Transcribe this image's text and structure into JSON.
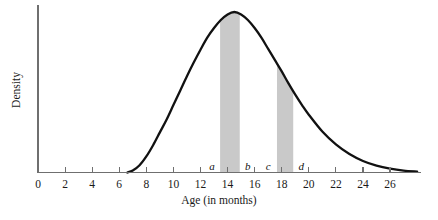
{
  "chart_data": {
    "type": "area",
    "title": "",
    "xlabel": "Age (in months)",
    "ylabel": "Density",
    "xlim": [
      0,
      28.2
    ],
    "ylim": [
      0,
      1.0
    ],
    "grid": false,
    "legend": null,
    "x_ticks": [
      0,
      2,
      4,
      6,
      8,
      10,
      12,
      14,
      16,
      18,
      20,
      22,
      24,
      26
    ],
    "x_tick_labels": [
      "0",
      "2",
      "4",
      "6",
      "8",
      "10",
      "12",
      "14",
      "16",
      "18",
      "20",
      "22",
      "24",
      "26"
    ],
    "y_ticks": [],
    "y_tick_labels": [],
    "curve_description": "Right-skewed unimodal density curve of age in months; rises from about age 7, peaks near age 14.5, long tail out past age 27",
    "curve_peak_x": 14.5,
    "curve_points": [
      {
        "x": 6.6,
        "y": 0.0
      },
      {
        "x": 7.0,
        "y": 0.012
      },
      {
        "x": 7.5,
        "y": 0.045
      },
      {
        "x": 8.0,
        "y": 0.1
      },
      {
        "x": 8.5,
        "y": 0.17
      },
      {
        "x": 9.0,
        "y": 0.25
      },
      {
        "x": 9.5,
        "y": 0.33
      },
      {
        "x": 10.0,
        "y": 0.42
      },
      {
        "x": 10.5,
        "y": 0.51
      },
      {
        "x": 11.0,
        "y": 0.6
      },
      {
        "x": 11.5,
        "y": 0.685
      },
      {
        "x": 12.0,
        "y": 0.765
      },
      {
        "x": 12.5,
        "y": 0.84
      },
      {
        "x": 13.0,
        "y": 0.9
      },
      {
        "x": 13.5,
        "y": 0.95
      },
      {
        "x": 14.0,
        "y": 0.985
      },
      {
        "x": 14.5,
        "y": 1.0
      },
      {
        "x": 15.0,
        "y": 0.985
      },
      {
        "x": 15.5,
        "y": 0.95
      },
      {
        "x": 16.0,
        "y": 0.9
      },
      {
        "x": 16.5,
        "y": 0.84
      },
      {
        "x": 17.0,
        "y": 0.77
      },
      {
        "x": 17.5,
        "y": 0.7
      },
      {
        "x": 18.0,
        "y": 0.63
      },
      {
        "x": 18.5,
        "y": 0.555
      },
      {
        "x": 19.0,
        "y": 0.485
      },
      {
        "x": 19.5,
        "y": 0.42
      },
      {
        "x": 20.0,
        "y": 0.36
      },
      {
        "x": 21.0,
        "y": 0.255
      },
      {
        "x": 22.0,
        "y": 0.175
      },
      {
        "x": 23.0,
        "y": 0.115
      },
      {
        "x": 24.0,
        "y": 0.072
      },
      {
        "x": 25.0,
        "y": 0.043
      },
      {
        "x": 26.0,
        "y": 0.024
      },
      {
        "x": 27.0,
        "y": 0.012
      },
      {
        "x": 28.0,
        "y": 0.006
      }
    ],
    "shaded_regions": [
      {
        "id": "region-ab",
        "start_label": "a",
        "end_label": "b",
        "start": 13.45,
        "end": 14.9,
        "color": "#c9c9c9"
      },
      {
        "id": "region-cd",
        "start_label": "c",
        "end_label": "d",
        "start": 17.65,
        "end": 18.85,
        "color": "#c9c9c9"
      }
    ],
    "point_labels": [
      {
        "text": "a",
        "x": 12.85
      },
      {
        "text": "b",
        "x": 15.5
      },
      {
        "text": "c",
        "x": 17.0
      },
      {
        "text": "d",
        "x": 19.45
      }
    ],
    "colors": {
      "curve": "#111111",
      "axis": "#6f6f6f",
      "shade": "#c9c9c9",
      "text": "#1a1a1a",
      "background": "#ffffff"
    }
  }
}
